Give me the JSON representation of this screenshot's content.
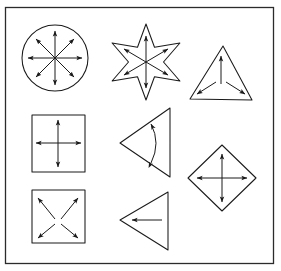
{
  "figure": {
    "background_color": "#ffffff",
    "stroke_color": "#1a1a1a",
    "frame_color": "#2b2b2b",
    "frame": {
      "x": 5,
      "y": 7,
      "width": 269,
      "height": 257
    },
    "shape_count": 8,
    "arrow_total": 31
  },
  "shapes": [
    {
      "id": "circle-eight-arrows",
      "name": "circle",
      "label": "Circle with eight radial arrows",
      "row": 1,
      "column": 1,
      "center": {
        "x": 55,
        "y": 58
      },
      "radius": 33,
      "arrow_count": 8,
      "arrow_style": "straight-single-head",
      "arrow_directions": [
        "up",
        "up-right",
        "right",
        "down-right",
        "down",
        "down-left",
        "left",
        "up-left"
      ],
      "arrow_origin": "center",
      "arrow_length": 27
    },
    {
      "id": "star-six-arrows",
      "name": "six-pointed-star",
      "label": "Six-pointed star with six radial arrows",
      "row": 1,
      "column": 2,
      "center": {
        "x": 146,
        "y": 62
      },
      "outer_radius": 38,
      "inner_radius": 17,
      "points": 6,
      "rotation_deg": -90,
      "arrow_count": 6,
      "arrow_style": "straight-single-head",
      "arrow_directions": [
        "up",
        "up-right",
        "down-right",
        "down",
        "down-left",
        "up-left"
      ],
      "arrow_origin": "center",
      "arrow_length": 26
    },
    {
      "id": "triangle-three-arrows",
      "name": "triangle-up",
      "label": "Upward triangle with three vertex arrows",
      "row": 1,
      "column": 3,
      "vertices": [
        [
          223,
          46
        ],
        [
          252,
          100
        ],
        [
          190,
          99
        ]
      ],
      "centroid": {
        "x": 221,
        "y": 82
      },
      "arrow_count": 3,
      "arrow_style": "straight-single-head",
      "arrow_directions": [
        "up",
        "down-left",
        "down-right"
      ],
      "arrow_origin": "centroid"
    },
    {
      "id": "square-cross-arrows",
      "name": "square",
      "label": "Square with four cross arrows",
      "row": 2,
      "column": 1,
      "rect": {
        "x": 32,
        "y": 115,
        "width": 53,
        "height": 57
      },
      "center": {
        "x": 58,
        "y": 143
      },
      "arrow_count": 4,
      "arrow_style": "straight-single-head",
      "arrow_directions": [
        "up",
        "right",
        "down",
        "left"
      ],
      "arrow_origin": "center",
      "arrow_length": 23
    },
    {
      "id": "triangle-curved-arrow",
      "name": "triangle-left",
      "label": "Left-pointing triangle with curved double-headed arrow",
      "row": 2,
      "column": 2,
      "vertices": [
        [
          170,
          108
        ],
        [
          170,
          177
        ],
        [
          120,
          143
        ]
      ],
      "arrow_count": 1,
      "arrow_style": "curved-double-head",
      "arrow_directions": [
        "clockwise-counterclockwise"
      ],
      "arc": {
        "start": [
          152,
          124
        ],
        "end": [
          152,
          163
        ],
        "bow": 10
      }
    },
    {
      "id": "diamond-cross-arrows",
      "name": "diamond",
      "label": "Diamond with four cross arrows",
      "row": 2,
      "column": 3,
      "center": {
        "x": 222,
        "y": 178
      },
      "half_width": 34,
      "half_height": 33,
      "arrow_count": 4,
      "arrow_style": "straight-single-head",
      "arrow_directions": [
        "up",
        "right",
        "down",
        "left"
      ],
      "arrow_origin": "center",
      "arrow_length": 24
    },
    {
      "id": "square-diagonal-arrows",
      "name": "square",
      "label": "Square with four diagonal corner arrows",
      "row": 3,
      "column": 1,
      "rect": {
        "x": 32,
        "y": 190,
        "width": 53,
        "height": 53
      },
      "center": {
        "x": 58,
        "y": 216
      },
      "arrow_count": 4,
      "arrow_style": "straight-single-head",
      "arrow_directions": [
        "up-left",
        "up-right",
        "down-right",
        "down-left"
      ],
      "arrow_origin": "center",
      "arrow_length": 23
    },
    {
      "id": "triangle-single-arrow",
      "name": "triangle-left",
      "label": "Left-pointing triangle with single leftward arrow",
      "row": 3,
      "column": 2,
      "vertices": [
        [
          168,
          192
        ],
        [
          168,
          250
        ],
        [
          120,
          220
        ]
      ],
      "arrow_count": 1,
      "arrow_style": "straight-single-head",
      "arrow_directions": [
        "left"
      ],
      "arrow_span": {
        "from": [
          162,
          220
        ],
        "to": [
          131,
          220
        ]
      }
    }
  ]
}
